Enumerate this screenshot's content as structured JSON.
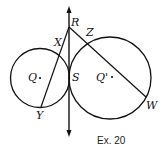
{
  "diagram": {
    "caption": "Ex. 20",
    "points": {
      "R": "R",
      "X": "X",
      "Z": "Z",
      "Q": "Q",
      "S": "S",
      "Q_prime": "Q'",
      "Y": "Y",
      "W": "W"
    },
    "circles": [
      {
        "name": "circle-Q",
        "center": "Q",
        "cx": 40.5,
        "cy": 78,
        "r": 30
      },
      {
        "name": "circle-Q-prime",
        "center": "Q'",
        "cx": 110,
        "cy": 78,
        "r": 41
      }
    ],
    "tangent_line": {
      "through": [
        "R",
        "S"
      ],
      "x": 69,
      "y1": 8,
      "y2": 136
    },
    "segments": [
      {
        "name": "secant-RY",
        "from": "R",
        "to": "Y"
      },
      {
        "name": "secant-RW",
        "from": "R",
        "to": "W"
      }
    ],
    "colors": {
      "stroke": "#111111",
      "background": "#ffffff"
    }
  }
}
